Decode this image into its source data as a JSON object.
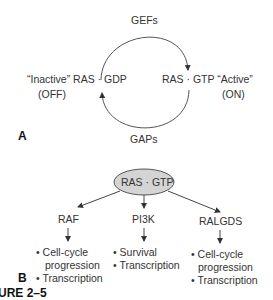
{
  "panel_a": {
    "label": "A",
    "top_label": "GEFs",
    "bottom_label": "GAPs",
    "left_state": "“Inactive” RAS · GDP",
    "left_status": "(OFF)",
    "right_state": "RAS · GTP “Active”",
    "right_status": "(ON)"
  },
  "panel_b": {
    "label": "B",
    "hub": "RAS · GTP",
    "hub_fill": "#d4d4d4",
    "effectors": [
      {
        "name": "RAF",
        "outcomes": [
          "• Cell-cycle",
          "  progression",
          "• Transcription"
        ]
      },
      {
        "name": "PI3K",
        "outcomes": [
          "• Survival",
          "• Transcription"
        ]
      },
      {
        "name": "RALGDS",
        "outcomes": [
          "• Cell-cycle",
          "  progression",
          "• Transcription"
        ]
      }
    ]
  },
  "caption": {
    "text": "URE 2–5"
  }
}
